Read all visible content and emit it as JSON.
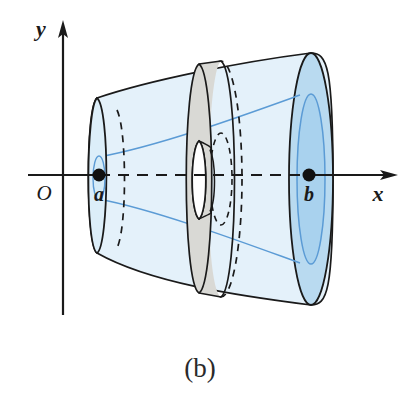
{
  "figure": {
    "caption": "(b)",
    "axes": {
      "x_label": "x",
      "y_label": "y",
      "origin_label": "O"
    },
    "points": [
      {
        "name": "a",
        "label": "a",
        "x": 99,
        "y": 175
      },
      {
        "name": "b",
        "label": "b",
        "x": 309,
        "y": 175
      }
    ],
    "colors": {
      "solid_light_blue": "#e4f1fa",
      "solid_mid_blue": "#b9daf0",
      "inner_blue_fill": "#a9d2ee",
      "washer_gray": "#d9d9d5",
      "outline_dark": "#1a1a1a",
      "curve_blue": "#5b9bd5",
      "background": "#ffffff"
    },
    "elements": {
      "solid_of_revolution": "outer surface generated by revolving a curve about the x-axis from a to b",
      "inner_cavity": "hollow inner surface generated by revolving a second curve",
      "representative_washer": "gray annular cross-section perpendicular to the x-axis",
      "axis_of_revolution": "dashed x-axis segment from a to b"
    }
  }
}
